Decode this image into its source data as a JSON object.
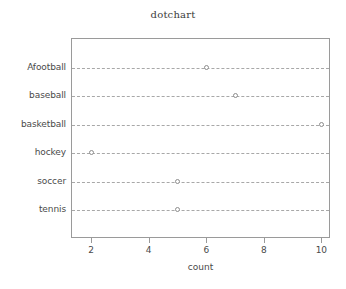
{
  "chart_data": {
    "type": "scatter",
    "title": "dotchart",
    "xlabel": "count",
    "ylabel": "",
    "categories": [
      "Afootball",
      "baseball",
      "basketball",
      "hockey",
      "soccer",
      "tennis"
    ],
    "values": [
      6,
      7,
      10,
      2,
      5,
      5
    ],
    "points": [
      {
        "category": "tennis",
        "value": 5
      },
      {
        "category": "soccer",
        "value": 5
      },
      {
        "category": "hockey",
        "value": 2
      },
      {
        "category": "basketball",
        "value": 10
      },
      {
        "category": "baseball",
        "value": 7
      },
      {
        "category": "Afootball",
        "value": 6
      }
    ],
    "x_ticks": [
      2,
      4,
      6,
      8,
      10
    ],
    "xlim": [
      1.3,
      10.3
    ],
    "grid": true,
    "grid_orientation": "horizontal",
    "legend": false,
    "marker": "open-circle",
    "colors": {
      "marker_stroke": "#8d8d8d",
      "gridline": "#a8a8a8",
      "frame": "#9a9a9a",
      "text": "#4a4a4a"
    }
  }
}
